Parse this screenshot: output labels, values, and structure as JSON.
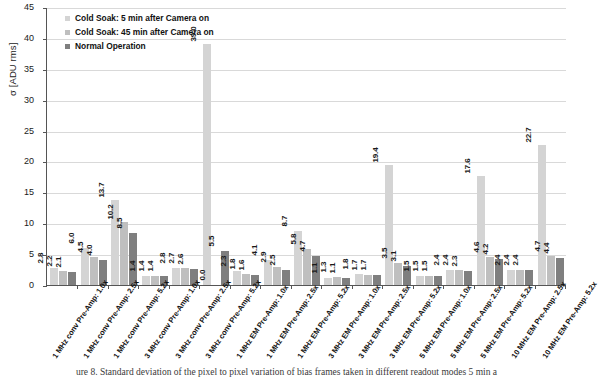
{
  "figure": {
    "caption": "ure 8. Standard deviation of the pixel to pixel variation of bias frames taken in different readout modes 5 min a"
  },
  "colors": {
    "series_cold_soak_5min": "#d4d4d4",
    "series_cold_soak_45min": "#bfbfbf",
    "series_normal_operation": "#7f7f7f",
    "axis": "#555555",
    "grid": "#d9d9d9",
    "text": "#111111"
  },
  "chart_data": {
    "type": "bar",
    "title": "",
    "xlabel": "",
    "ylabel": "σ [ADU rms]",
    "ylim": [
      0,
      45
    ],
    "yticks": [
      0,
      5,
      10,
      15,
      20,
      25,
      30,
      35,
      40,
      45
    ],
    "grid": true,
    "legend_position": "top-left",
    "categories": [
      "1 MHz conv Pre-Amp: 1.0x",
      "1 MHz conv Pre-Amp: 2.5x",
      "1 MHz conv Pre-Amp: 5.2x",
      "3 MHz conv Pre-Amp: 1.0x",
      "3 MHz conv Pre-Amp: 2.5x",
      "3 MHz conv Pre-Amp: 5.2x",
      "1 MHz EM Pre-Amp: 1.0x",
      "1 MHz EM Pre-Amp: 2.5x",
      "1 MHz EM Pre-Amp: 5.2x",
      "3 MHz EM Pre-Amp: 1.0x",
      "3 MHz EM Pre-Amp: 2.5x",
      "3 MHz EM Pre-Amp: 5.2x",
      "5 MHz EM Pre-Amp: 1.0x",
      "5 MHz EM Pre-Amp: 2.5x",
      "5 MHz EM Pre-Amp: 5.2x",
      "10 MHz EM Pre-Amp: 2.5x",
      "10 MHz EM Pre-Amp: 5.2x"
    ],
    "series": [
      {
        "name": "Cold Soak: 5 min after Camera on",
        "color": "#d4d4d4",
        "values": [
          2.8,
          6.0,
          13.7,
          1.4,
          2.8,
          39.0,
          2.3,
          4.1,
          8.7,
          1.1,
          1.8,
          19.4,
          1.5,
          2.4,
          17.6,
          2.4,
          22.7
        ]
      },
      {
        "name": "Cold Soak: 45 min after Camera on",
        "color": "#bfbfbf",
        "values": [
          2.2,
          4.5,
          10.2,
          1.4,
          2.7,
          0.0,
          1.8,
          2.9,
          5.8,
          1.3,
          1.7,
          3.5,
          1.5,
          2.4,
          4.6,
          2.4,
          4.7
        ]
      },
      {
        "name": "Normal Operation",
        "color": "#7f7f7f",
        "values": [
          2.1,
          4.0,
          8.5,
          1.4,
          2.6,
          5.5,
          1.6,
          2.5,
          4.7,
          1.1,
          1.7,
          3.1,
          1.5,
          2.3,
          4.2,
          2.4,
          4.4
        ]
      }
    ]
  }
}
